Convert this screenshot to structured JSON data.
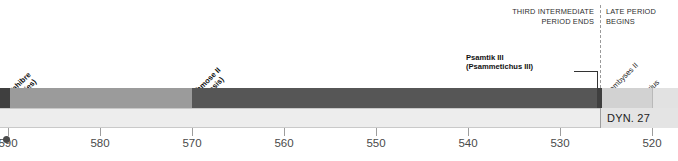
{
  "chart_data": {
    "type": "bar",
    "title": "",
    "subtitle": "",
    "orientation": "horizontal-timeline",
    "xlabel": "Year BCE",
    "ylabel": "",
    "xlim": [
      592,
      518
    ],
    "x_direction": "descending",
    "grid": false,
    "legend_position": "none",
    "axis": {
      "ticks": [
        590,
        580,
        570,
        560,
        550,
        540,
        530,
        520
      ],
      "tick_labels": [
        "590",
        "580",
        "570",
        "560",
        "550",
        "540",
        "530",
        "520"
      ],
      "tick_px": [
        8,
        100,
        192,
        284,
        376,
        468,
        560,
        652
      ],
      "px_per_decade": 92,
      "first_tick_clipped": true
    },
    "series": [
      {
        "name": "Reigns",
        "bars": [
          {
            "label": "Wahibre",
            "label_alt": "(Apries)",
            "start": 592,
            "end": 570,
            "x_px": 0,
            "width_px": 192,
            "tone": "tone-mid",
            "has_pre_segment": true,
            "pre_segment_px": 10
          },
          {
            "label": "Ahmose II",
            "label_alt": "(Amasis)",
            "start": 570,
            "end": 526,
            "x_px": 192,
            "width_px": 405,
            "tone": "tone-dark"
          },
          {
            "label": "Psamtik III",
            "label_alt": "(Psammetichus III)",
            "start": 526,
            "end": 525,
            "x_px": 597,
            "width_px": 5,
            "tone": "tone-darkest"
          },
          {
            "label": "Cambyses II",
            "label_alt": "",
            "start": 525,
            "end": 522,
            "x_px": 602,
            "width_px": 50,
            "tone": "tone-pale"
          },
          {
            "label": "Darius I",
            "label_alt": "",
            "start": 522,
            "end": 518,
            "x_px": 652,
            "width_px": 26,
            "tone": "tone-paler"
          }
        ]
      }
    ],
    "annotations": [
      {
        "name": "third-intermediate-period-ends",
        "text": "THIRD INTERMEDIATE\nPERIOD ENDS",
        "x_px": 600,
        "side": "left"
      },
      {
        "name": "late-period-begins",
        "text": "LATE PERIOD\nBEGINS",
        "x_px": 600,
        "side": "right"
      },
      {
        "name": "dynasty-27",
        "text": "DYN. 27",
        "x_px": 600
      }
    ]
  },
  "header": {
    "left_note": "THIRD INTERMEDIATE\nPERIOD ENDS",
    "right_note": "LATE PERIOD\nBEGINS"
  },
  "labels": {
    "wahibre": "Wahibre\n(Apries)",
    "ahmose": "Ahmose II\n(Amasis)",
    "psamtik": "Psamtik III\n(Psammetichus III)",
    "cambyses": "Cambyses II",
    "darius": "Darius I"
  },
  "dynasty": {
    "name": "DYN. 27"
  }
}
